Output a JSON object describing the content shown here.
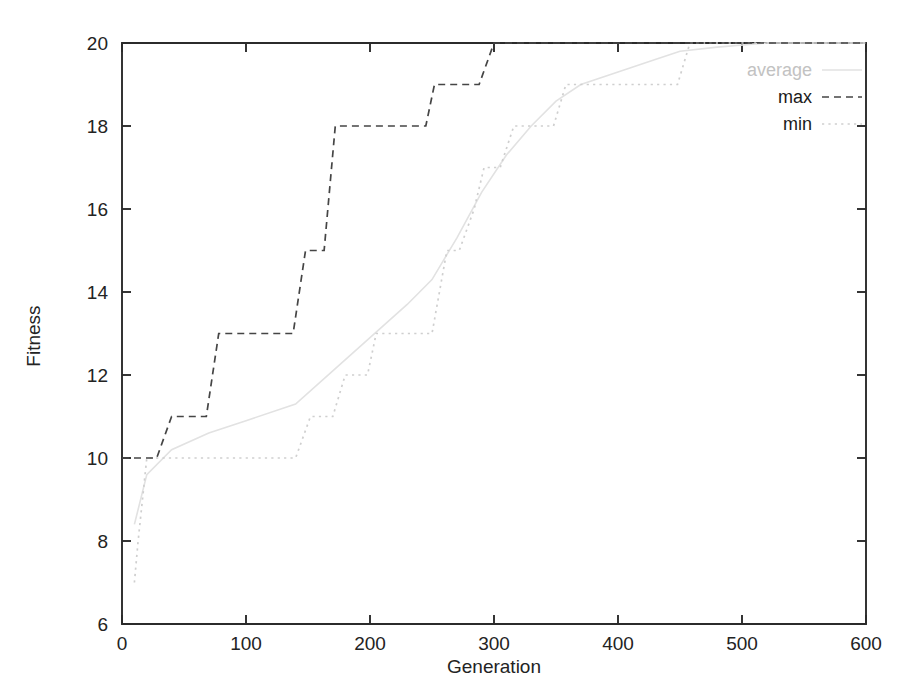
{
  "chart_data": {
    "type": "line",
    "title": "",
    "xlabel": "Generation",
    "ylabel": "Fitness",
    "xlim": [
      0,
      600
    ],
    "ylim": [
      6,
      20
    ],
    "xticks": [
      0,
      100,
      200,
      300,
      400,
      500,
      600
    ],
    "yticks": [
      6,
      8,
      10,
      12,
      14,
      16,
      18,
      20
    ],
    "xtick_labels": [
      "0",
      "100",
      "200",
      "300",
      "400",
      "500",
      "600"
    ],
    "ytick_labels": [
      "6",
      "8",
      "10",
      "12",
      "14",
      "16",
      "18",
      "20"
    ],
    "grid": false,
    "legend_position": "top-right inside",
    "series": [
      {
        "name": "average",
        "style": "solid-faint",
        "color": "#e2e2e2",
        "points": [
          [
            10,
            8.4
          ],
          [
            20,
            9.6
          ],
          [
            40,
            10.2
          ],
          [
            70,
            10.6
          ],
          [
            100,
            10.9
          ],
          [
            140,
            11.3
          ],
          [
            170,
            12.1
          ],
          [
            200,
            12.9
          ],
          [
            230,
            13.7
          ],
          [
            250,
            14.3
          ],
          [
            270,
            15.3
          ],
          [
            290,
            16.4
          ],
          [
            310,
            17.3
          ],
          [
            330,
            18.0
          ],
          [
            350,
            18.6
          ],
          [
            370,
            19.0
          ],
          [
            400,
            19.3
          ],
          [
            430,
            19.6
          ],
          [
            450,
            19.8
          ],
          [
            480,
            19.9
          ],
          [
            520,
            20.0
          ],
          [
            600,
            20.0
          ]
        ]
      },
      {
        "name": "max",
        "style": "dashed",
        "color": "#454545",
        "points": [
          [
            0,
            10
          ],
          [
            28,
            10
          ],
          [
            40,
            11
          ],
          [
            68,
            11
          ],
          [
            78,
            13
          ],
          [
            138,
            13
          ],
          [
            148,
            15
          ],
          [
            163,
            15
          ],
          [
            172,
            18
          ],
          [
            245,
            18
          ],
          [
            252,
            19
          ],
          [
            288,
            19
          ],
          [
            300,
            20
          ],
          [
            600,
            20
          ]
        ]
      },
      {
        "name": "min",
        "style": "dotted",
        "color": "#cfcfcf",
        "points": [
          [
            10,
            7
          ],
          [
            13,
            8
          ],
          [
            20,
            10
          ],
          [
            140,
            10
          ],
          [
            152,
            11
          ],
          [
            170,
            11
          ],
          [
            180,
            12
          ],
          [
            198,
            12
          ],
          [
            205,
            13
          ],
          [
            250,
            13
          ],
          [
            262,
            15
          ],
          [
            272,
            15
          ],
          [
            284,
            16
          ],
          [
            292,
            17
          ],
          [
            305,
            17
          ],
          [
            316,
            18
          ],
          [
            348,
            18
          ],
          [
            358,
            19
          ],
          [
            448,
            19
          ],
          [
            458,
            20
          ],
          [
            600,
            20
          ]
        ]
      }
    ]
  },
  "legend": {
    "entries": [
      {
        "label": "average",
        "style": "solid-faint"
      },
      {
        "label": "max",
        "style": "dashed"
      },
      {
        "label": "min",
        "style": "dotted"
      }
    ]
  },
  "axes": {
    "x_title": "Generation",
    "y_title": "Fitness"
  }
}
